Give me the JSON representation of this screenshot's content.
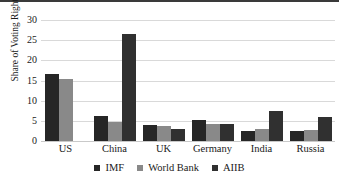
{
  "chart_data": {
    "type": "bar",
    "title": "",
    "xlabel": "",
    "ylabel": "Share of Voting Rights (%)",
    "ylim": [
      0,
      30
    ],
    "yticks": [
      30,
      25,
      20,
      15,
      10,
      5,
      0
    ],
    "grid": true,
    "legend_position": "bottom",
    "categories": [
      "US",
      "China",
      "UK",
      "Germany",
      "India",
      "Russia"
    ],
    "series": [
      {
        "name": "IMF",
        "color": "#262626",
        "values": [
          16.5,
          6.1,
          4.0,
          5.1,
          2.6,
          2.6
        ]
      },
      {
        "name": "World Bank",
        "color": "#898989",
        "values": [
          15.4,
          4.8,
          3.8,
          4.2,
          3.1,
          2.7
        ]
      },
      {
        "name": "AIIB",
        "color": "#303030",
        "values": [
          null,
          26.6,
          3.0,
          4.3,
          7.5,
          5.9
        ]
      }
    ]
  }
}
